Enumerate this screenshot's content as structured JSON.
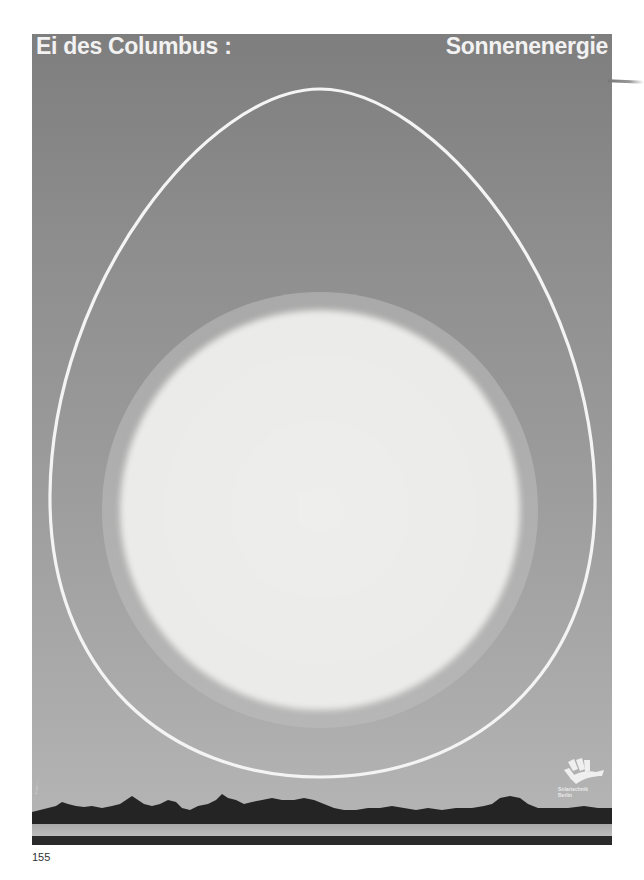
{
  "poster": {
    "title_left": "Ei des Columbus :",
    "title_right": "Sonnenenergie",
    "background_top_color": "#7e7e7e",
    "background_bottom_color": "#b4b4b4",
    "egg_outline_color": "#f4f4f4",
    "sun_color": "#ebebe9",
    "credit_text": "Foto: ...",
    "logo": {
      "icon": "sun-rays-hand-icon",
      "line1": "Solartechnik",
      "line2": "Berlin"
    }
  },
  "page": {
    "number": "155"
  }
}
